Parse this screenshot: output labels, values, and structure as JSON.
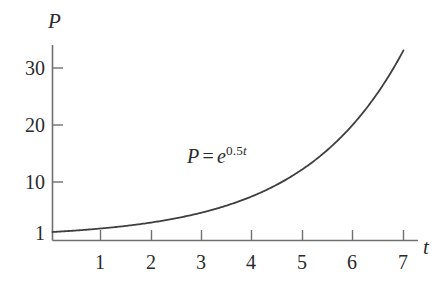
{
  "chart_data": {
    "type": "line",
    "title": "",
    "xlabel": "t",
    "ylabel": "P",
    "equation_display": "P = e^{0.5t}",
    "equation_parts": {
      "lhs": "P",
      "operator": "=",
      "base": "e",
      "exponent_coefficient": "0.5",
      "exponent_variable": "t"
    },
    "formula": "P = e^(0.5t)",
    "xlim": [
      0,
      7.6
    ],
    "ylim": [
      1,
      34
    ],
    "grid": false,
    "legend": null,
    "x_ticks": [
      1,
      2,
      3,
      4,
      5,
      6,
      7
    ],
    "x_tick_labels": [
      "1",
      "2",
      "3",
      "4",
      "5",
      "6",
      "7"
    ],
    "y_ticks": [
      1,
      10,
      20,
      30
    ],
    "y_tick_labels": [
      "1",
      "10",
      "20",
      "30"
    ],
    "series": [
      {
        "name": "P = e^0.5t",
        "x": [
          0,
          0.5,
          1,
          1.5,
          2,
          2.5,
          3,
          3.5,
          4,
          4.5,
          5,
          5.5,
          6,
          6.5,
          7
        ],
        "y": [
          1,
          1.28,
          1.65,
          2.12,
          2.72,
          3.49,
          4.48,
          5.75,
          7.39,
          9.49,
          12.18,
          15.64,
          20.09,
          25.79,
          33.12
        ]
      }
    ],
    "curve_color": "#3f3f3f",
    "axis_color": "#6f6f6f"
  },
  "labels": {
    "y_axis_name": "P",
    "x_axis_name": "t",
    "y_30": "30",
    "y_20": "20",
    "y_10": "10",
    "y_1": "1",
    "x_1": "1",
    "x_2": "2",
    "x_3": "3",
    "x_4": "4",
    "x_5": "5",
    "x_6": "6",
    "x_7": "7",
    "equation_lhs": "P",
    "equation_operator": "=",
    "equation_base": "e",
    "equation_exp_coef": "0.5",
    "equation_exp_var": "t"
  }
}
